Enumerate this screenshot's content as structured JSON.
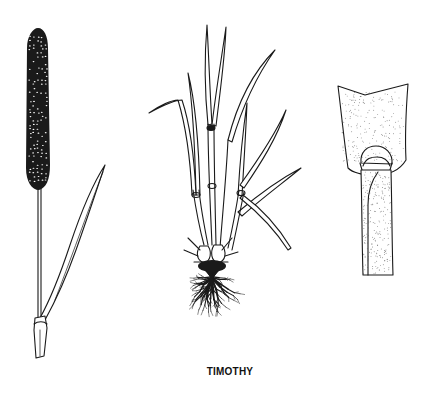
{
  "illustration": {
    "subject": "Timothy grass botanical illustration",
    "caption": "TIMOTHY",
    "panels": [
      {
        "name": "seed-head",
        "description": "Flowering stem with dense cylindrical spike and leaf"
      },
      {
        "name": "whole-plant",
        "description": "Tufted plant with leaves, bulbous base and fibrous roots"
      },
      {
        "name": "ligule-detail",
        "description": "Close-up of leaf sheath and membranous ligule"
      }
    ],
    "colors": {
      "ink": "#1a1a1a",
      "paper": "#ffffff"
    }
  }
}
